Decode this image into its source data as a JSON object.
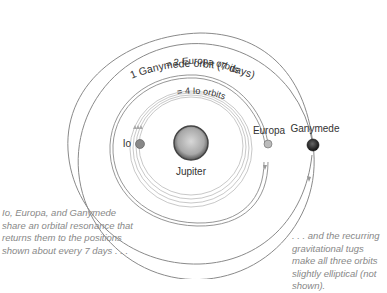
{
  "diagram": {
    "title_arcs": {
      "ganymede": "1 Ganymede orbit (7 days)",
      "europa": "= 2 Europa orbits",
      "io": "= 4 Io orbits"
    },
    "bodies": {
      "jupiter": "Jupiter",
      "io": "Io",
      "europa": "Europa",
      "ganymede": "Ganymede"
    },
    "notes": {
      "left": "Io, Europa, and Ganymede share an orbital resonance that returns them to the positions shown about every 7 days . . .",
      "right": ". . . and the recurring gravitational tugs make all three orbits slightly elliptical (not shown)."
    },
    "colors": {
      "orbit_line": "#8a8a8a",
      "jupiter": "#9a9a9a",
      "ganymede": "#222222",
      "note_text": "#888888"
    }
  }
}
